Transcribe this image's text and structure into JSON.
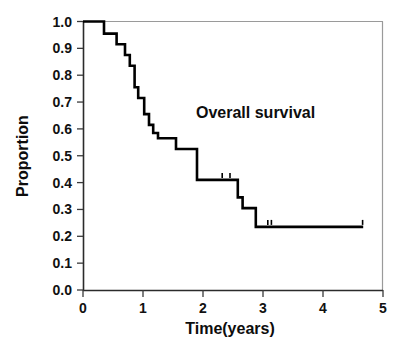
{
  "chart_data": {
    "type": "line",
    "subtype": "kaplan-meier-step",
    "title": "",
    "xlabel": "Time(years)",
    "ylabel": "Proportion",
    "xlim": [
      0,
      5
    ],
    "ylim": [
      0.0,
      1.0
    ],
    "grid": false,
    "legend": "none",
    "xticks": [
      0,
      1,
      2,
      3,
      4,
      5
    ],
    "xtick_labels": [
      "0",
      "1",
      "2",
      "3",
      "4",
      "5"
    ],
    "yticks": [
      0.0,
      0.1,
      0.2,
      0.3,
      0.4,
      0.5,
      0.6,
      0.7,
      0.8,
      0.9,
      1.0
    ],
    "ytick_labels": [
      "0.0",
      "0.1",
      "0.2",
      "0.3",
      "0.4",
      "0.5",
      "0.6",
      "0.7",
      "0.8",
      "0.9",
      "1.0"
    ],
    "annotations": [
      {
        "text": "Overall survival",
        "x": 2.3,
        "y": 0.72
      }
    ],
    "series": [
      {
        "name": "Overall survival",
        "color": "#000000",
        "x": [
          0.0,
          0.35,
          0.35,
          0.56,
          0.56,
          0.7,
          0.7,
          0.78,
          0.78,
          0.86,
          0.86,
          0.92,
          0.92,
          1.02,
          1.02,
          1.1,
          1.1,
          1.17,
          1.17,
          1.25,
          1.25,
          1.55,
          1.55,
          1.9,
          1.9,
          2.58,
          2.58,
          2.66,
          2.66,
          2.88,
          2.88,
          4.67
        ],
        "y": [
          1.0,
          1.0,
          0.955,
          0.955,
          0.915,
          0.915,
          0.875,
          0.875,
          0.835,
          0.835,
          0.755,
          0.755,
          0.715,
          0.715,
          0.655,
          0.655,
          0.615,
          0.615,
          0.585,
          0.585,
          0.565,
          0.565,
          0.525,
          0.525,
          0.41,
          0.41,
          0.345,
          0.345,
          0.305,
          0.305,
          0.235,
          0.235
        ]
      }
    ],
    "censor_marks": [
      {
        "x": 2.32,
        "y": 0.41
      },
      {
        "x": 2.45,
        "y": 0.41
      },
      {
        "x": 3.08,
        "y": 0.235
      },
      {
        "x": 3.14,
        "y": 0.235
      },
      {
        "x": 4.66,
        "y": 0.235
      }
    ]
  },
  "axes": {
    "y_axis_title": "Proportion",
    "x_axis_title": "Time(years)"
  }
}
